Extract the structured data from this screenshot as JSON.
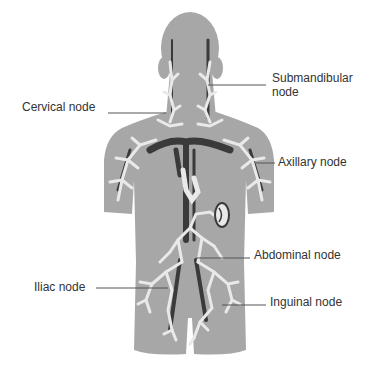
{
  "diagram": {
    "colors": {
      "body": "#a7a7a7",
      "vessels": "#3a3a3a",
      "nodes": "#e9e9e9",
      "leader_lines": "#555555",
      "text": "#333333"
    },
    "labels": [
      {
        "id": "submandibular",
        "line1": "Submandibular",
        "line2": "node"
      },
      {
        "id": "cervical",
        "text": "Cervical node"
      },
      {
        "id": "axillary",
        "text": "Axillary node"
      },
      {
        "id": "abdominal",
        "text": "Abdominal node"
      },
      {
        "id": "iliac",
        "text": "Iliac node"
      },
      {
        "id": "inguinal",
        "text": "Inguinal node"
      }
    ]
  }
}
